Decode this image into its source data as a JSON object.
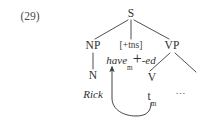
{
  "figure": {
    "example_number": "(29)",
    "caption": "",
    "ink_color": "#2f2f2f",
    "background_color": "#ffffff"
  },
  "tree": {
    "nodes": [
      {
        "id": "S",
        "label": "S",
        "x": 131,
        "y": 14,
        "kind": "category"
      },
      {
        "id": "NP",
        "label": "NP",
        "x": 93,
        "y": 46,
        "kind": "category"
      },
      {
        "id": "TNS",
        "label": "[+tns]",
        "x": 131,
        "y": 46,
        "kind": "feature"
      },
      {
        "id": "VP",
        "label": "VP",
        "x": 172,
        "y": 46,
        "kind": "category"
      },
      {
        "id": "N",
        "label": "N",
        "x": 93,
        "y": 76,
        "kind": "category"
      },
      {
        "id": "V",
        "label": "V",
        "x": 152,
        "y": 78,
        "kind": "category"
      }
    ],
    "terminals": [
      {
        "id": "rick",
        "label": "Rick",
        "x": 93,
        "y": 94,
        "style": "italic"
      },
      {
        "id": "trace",
        "base": "t",
        "subscript": "m",
        "x": 152,
        "y": 97,
        "style": "roman"
      },
      {
        "id": "dots",
        "label": "…",
        "x": 181,
        "y": 91,
        "style": "ellipsis"
      }
    ],
    "affix_host": {
      "id": "have-ed",
      "base": "have",
      "subscript": "m",
      "connector": "+",
      "affix": "-ed",
      "x": 131,
      "y": 61
    },
    "edges": [
      {
        "from": "S",
        "to": "NP"
      },
      {
        "from": "S",
        "to": "TNS"
      },
      {
        "from": "S",
        "to": "VP"
      },
      {
        "from": "NP",
        "to": "N"
      },
      {
        "from": "VP",
        "to": "V"
      },
      {
        "from": "VP",
        "to": "XP-ellipsis"
      }
    ],
    "movement_arrow": {
      "id": "head-movement",
      "from": "trace",
      "to": "have-ed",
      "description": "curved arrow from t-m up to have-m"
    }
  }
}
